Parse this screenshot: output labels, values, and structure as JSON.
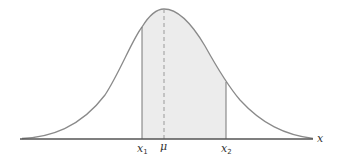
{
  "diagram": {
    "type": "normal-distribution",
    "labels": {
      "x1": "x",
      "x1_sub": "1",
      "mu": "μ",
      "x2": "x",
      "x2_sub": "2",
      "axis": "x"
    },
    "colors": {
      "curve": "#8a8a8a",
      "axis": "#555555",
      "shade": "#ececec",
      "bound_line": "#777777",
      "mean_line": "#9a9a9a"
    }
  }
}
